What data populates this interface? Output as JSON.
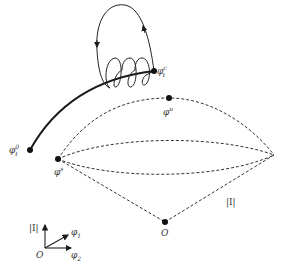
{
  "diagram": {
    "points": {
      "phi_t_c": {
        "label": "φ",
        "sup": "c",
        "sub": "t"
      },
      "phi_t_0": {
        "label": "φ",
        "sup": "0",
        "sub": "t"
      },
      "phi_u": {
        "label": "φ",
        "sup": "u"
      },
      "phi_s": {
        "label": "φ",
        "sup": "s"
      },
      "origin": {
        "label": "O"
      }
    },
    "edge_label": "|I|",
    "axes": {
      "vertical": "|I|",
      "diag": "φ",
      "diag_sub": "1",
      "horiz": "φ",
      "horiz_sub": "2",
      "origin": "O"
    },
    "colors": {
      "stroke": "#1a1a1a",
      "dashed": "#333333"
    }
  }
}
